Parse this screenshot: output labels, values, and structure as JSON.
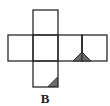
{
  "figure": {
    "type": "cube-net",
    "option_label": "B",
    "colors": {
      "stroke": "#2a2a2a",
      "fill_marker": "#6b6b6b",
      "background": "#ffffff"
    },
    "cells": [
      {
        "id": "top",
        "row": 0,
        "col": 1
      },
      {
        "id": "left",
        "row": 1,
        "col": 0
      },
      {
        "id": "center",
        "row": 1,
        "col": 1
      },
      {
        "id": "right-1",
        "row": 1,
        "col": 2,
        "marker": "triangle-with-center-line"
      },
      {
        "id": "right-2",
        "row": 1,
        "col": 3
      },
      {
        "id": "bottom",
        "row": 2,
        "col": 1,
        "marker": "corner-triangle-bottom-right"
      }
    ]
  }
}
